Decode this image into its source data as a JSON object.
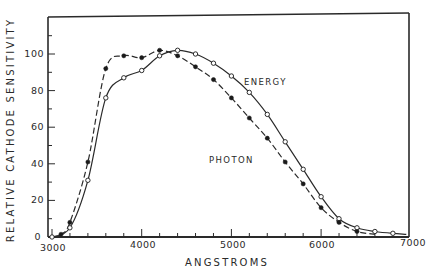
{
  "chart_data": {
    "type": "line",
    "title": "",
    "xlabel": "ANGSTROMS",
    "ylabel": "RELATIVE CATHODE SENSITIVITY",
    "xlim": [
      3000,
      7000
    ],
    "ylim": [
      0,
      120
    ],
    "x_ticks": [
      3000,
      4000,
      5000,
      6000,
      7000
    ],
    "x_tick_labels": [
      "3000",
      "4000",
      "5000",
      "6000",
      "7000"
    ],
    "y_ticks": [
      0,
      20,
      40,
      60,
      80,
      100
    ],
    "y_tick_labels": [
      "0",
      "20",
      "40",
      "60",
      "80",
      "100"
    ],
    "grid": false,
    "legend": "inline labels",
    "series": [
      {
        "name": "ENERGY",
        "line_style": "solid",
        "marker": "open-circle",
        "x": [
          3000,
          3200,
          3400,
          3600,
          3800,
          4000,
          4200,
          4400,
          4600,
          4800,
          5000,
          5200,
          5400,
          5600,
          5800,
          6000,
          6200,
          6400,
          6600,
          6800
        ],
        "values": [
          0,
          5,
          31,
          76,
          87,
          91,
          99,
          102,
          100,
          95,
          88,
          79,
          67,
          52,
          37,
          22,
          10,
          5,
          3,
          2
        ]
      },
      {
        "name": "PHOTON",
        "line_style": "dashed",
        "marker": "filled-circle",
        "x": [
          3100,
          3200,
          3400,
          3600,
          3800,
          4000,
          4200,
          4400,
          4600,
          4800,
          5000,
          5200,
          5400,
          5600,
          5800,
          6000,
          6200,
          6400
        ],
        "values": [
          1.5,
          8,
          41,
          92,
          99,
          98,
          102,
          99,
          93,
          86,
          76,
          65,
          54,
          41,
          29,
          16,
          8,
          3
        ]
      }
    ],
    "annotations": [
      {
        "text": "ENERGY",
        "x": 5350,
        "y": 85
      },
      {
        "text": "PHOTON",
        "x": 4950,
        "y": 42
      }
    ]
  },
  "labels": {
    "xlabel": "ANGSTROMS",
    "ylabel": "RELATIVE CATHODE SENSITIVITY",
    "energy": "ENERGY",
    "photon": "PHOTON",
    "x_ticks": [
      "3000",
      "4000",
      "5000",
      "6000",
      "7000"
    ],
    "y_ticks": [
      "0",
      "20",
      "40",
      "60",
      "80",
      "100"
    ]
  },
  "colors": {
    "ink": "#2a2a2a",
    "background": "#ffffff"
  }
}
